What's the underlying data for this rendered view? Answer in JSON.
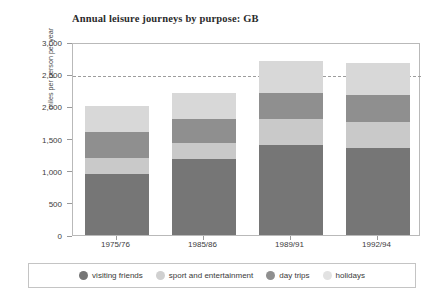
{
  "chart_data": {
    "type": "bar",
    "subtype": "stacked-bar",
    "title": "Annual leisure journeys by purpose: GB",
    "xlabel": "",
    "ylabel": "miles per person per year",
    "categories": [
      "1975/76",
      "1985/86",
      "1989/91",
      "1992/94"
    ],
    "ylim": [
      0,
      3000
    ],
    "ytick_labels": [
      "0",
      "500",
      "1,000",
      "1,500",
      "2,000",
      "2,500",
      "3,000"
    ],
    "ytick_values": [
      0,
      500,
      1000,
      1500,
      2000,
      2500,
      3000
    ],
    "grid": "dashed reference line at 2,500",
    "gridline_values": [
      2500
    ],
    "legend_position": "bottom",
    "stack_order_bottom_to_top": [
      "visiting friends",
      "day trips",
      "sport and entertainment",
      "holidays"
    ],
    "series": [
      {
        "name": "visiting friends",
        "color": "#767676",
        "values": [
          950,
          1175,
          1400,
          1350
        ]
      },
      {
        "name": "day trips",
        "color": "#c9c9c9",
        "values": [
          250,
          250,
          400,
          400
        ]
      },
      {
        "name": "sport and entertainment",
        "color": "#8f8f8f",
        "values": [
          400,
          375,
          400,
          425
        ]
      },
      {
        "name": "holidays",
        "color": "#d8d8d8",
        "values": [
          400,
          400,
          500,
          500
        ]
      }
    ],
    "totals": [
      2000,
      2200,
      2700,
      2675
    ]
  },
  "legend": {
    "items": [
      {
        "label": "visiting friends",
        "color": "#767676"
      },
      {
        "label": "sport and entertainment",
        "color": "#d0d0d0"
      },
      {
        "label": "day trips",
        "color": "#8f8f8f"
      },
      {
        "label": "holidays",
        "color": "#e2e2e2"
      }
    ]
  },
  "colors": {
    "frame": "#b9b9b9",
    "axis_text": "#3c3c3c",
    "title_text": "#2b2b2b",
    "background": "#ffffff",
    "gridline": "#9d9d9d"
  }
}
